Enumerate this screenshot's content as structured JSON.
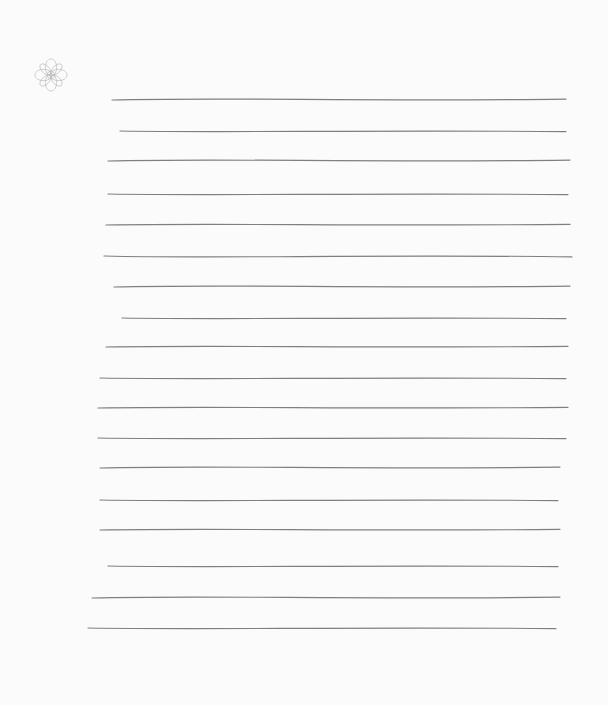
{
  "page": {
    "type": "lined-paper",
    "background": "#fbfbfb",
    "line_color": "#555555",
    "ornament": {
      "icon": "celtic-knot-icon",
      "color": "#b8b8b8"
    },
    "lines": [
      {
        "y": 100,
        "x1": 112,
        "x2": 566,
        "wave": 3
      },
      {
        "y": 131,
        "x1": 120,
        "x2": 566,
        "wave": 2
      },
      {
        "y": 161,
        "x1": 108,
        "x2": 570,
        "wave": 3
      },
      {
        "y": 194,
        "x1": 108,
        "x2": 568,
        "wave": 2
      },
      {
        "y": 225,
        "x1": 106,
        "x2": 570,
        "wave": 2
      },
      {
        "y": 256,
        "x1": 104,
        "x2": 572,
        "wave": 3
      },
      {
        "y": 287,
        "x1": 114,
        "x2": 570,
        "wave": 3
      },
      {
        "y": 318,
        "x1": 122,
        "x2": 566,
        "wave": 2
      },
      {
        "y": 347,
        "x1": 106,
        "x2": 568,
        "wave": 2
      },
      {
        "y": 378,
        "x1": 100,
        "x2": 566,
        "wave": 2
      },
      {
        "y": 408,
        "x1": 98,
        "x2": 568,
        "wave": 2
      },
      {
        "y": 438,
        "x1": 98,
        "x2": 566,
        "wave": 2
      },
      {
        "y": 468,
        "x1": 100,
        "x2": 560,
        "wave": 3
      },
      {
        "y": 500,
        "x1": 100,
        "x2": 558,
        "wave": 2
      },
      {
        "y": 530,
        "x1": 100,
        "x2": 560,
        "wave": 2
      },
      {
        "y": 566,
        "x1": 108,
        "x2": 558,
        "wave": 2
      },
      {
        "y": 598,
        "x1": 92,
        "x2": 560,
        "wave": 3
      },
      {
        "y": 628,
        "x1": 88,
        "x2": 556,
        "wave": 2
      }
    ]
  }
}
